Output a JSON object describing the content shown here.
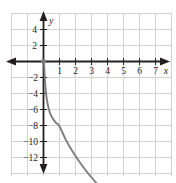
{
  "figure": {
    "width": 176,
    "height": 183,
    "background_color": "#ffffff",
    "grid_color": "#d2d3d5",
    "axis_color": "#231f20",
    "curve_color": "#7d7d80"
  },
  "axes": {
    "x_axis_name": "x",
    "y_axis_name": "y",
    "x_tick_labels": [
      "1",
      "2",
      "3",
      "4",
      "5",
      "6",
      "7"
    ],
    "y_tick_labels_positive": [
      "4",
      "2"
    ],
    "y_tick_labels_negative": [
      "−2",
      "−4",
      "−6",
      "−8",
      "−10",
      "−12"
    ]
  },
  "chart_data": {
    "type": "line",
    "title": "",
    "xlabel": "x",
    "ylabel": "y",
    "xlim": [
      -2,
      8
    ],
    "ylim": [
      -13,
      5
    ],
    "grid": true,
    "legend": null,
    "x_ticks": [
      1,
      2,
      3,
      4,
      5,
      6,
      7
    ],
    "y_ticks": [
      4,
      2,
      -2,
      -4,
      -6,
      -8,
      -10,
      -12
    ],
    "series": [
      {
        "name": "curve",
        "color": "#7d7d80",
        "start_marker": "dot",
        "end_marker": "arrow",
        "x": [
          0.04,
          0.08,
          0.15,
          0.25,
          0.4,
          0.6,
          0.8,
          1.0,
          1.4,
          1.8,
          2.2,
          2.6,
          3.0,
          3.5,
          4.0,
          4.5,
          5.0,
          5.5,
          6.0,
          6.5,
          7.0,
          7.5
        ],
        "y": [
          -0.2,
          -1.0,
          -1.9,
          -2.6,
          -3.2,
          -3.6,
          -3.85,
          -4.05,
          -4.9,
          -5.6,
          -6.2,
          -6.75,
          -7.25,
          -7.8,
          -8.3,
          -8.75,
          -9.2,
          -9.6,
          -10.0,
          -10.35,
          -10.7,
          -11.05
        ]
      }
    ],
    "annotations": [
      {
        "name": "origin-point",
        "x": 0,
        "y": 0,
        "marker": "dot"
      }
    ]
  }
}
